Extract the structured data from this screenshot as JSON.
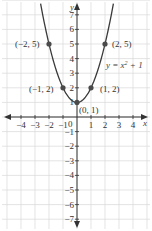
{
  "chart_data": {
    "type": "line",
    "title": "",
    "equation": "y = x² + 1",
    "xlabel": "x",
    "ylabel": "y",
    "xlim": [
      -4,
      4
    ],
    "ylim": [
      -7,
      7
    ],
    "grid": true,
    "x_ticks": [
      -4,
      -3,
      -2,
      -1,
      0,
      1,
      2,
      3,
      4
    ],
    "y_ticks": [
      -7,
      -6,
      -5,
      -4,
      -3,
      -2,
      -1,
      1,
      2,
      3,
      4,
      5,
      6,
      7
    ],
    "series": [
      {
        "name": "y = x² + 1",
        "function": "x^2+1",
        "x_range": [
          -2.6,
          2.6
        ],
        "color": "#3a3a3a"
      }
    ],
    "points": [
      {
        "x": -2,
        "y": 5,
        "label": "(−2, 5)"
      },
      {
        "x": -1,
        "y": 2,
        "label": "(−1, 2)"
      },
      {
        "x": 0,
        "y": 1,
        "label": "(0, 1)"
      },
      {
        "x": 1,
        "y": 2,
        "label": "(1, 2)"
      },
      {
        "x": 2,
        "y": 5,
        "label": "(2, 5)"
      }
    ]
  },
  "labels": {
    "x_axis": "x",
    "y_axis": "y",
    "equation": "y = x",
    "equation_exp": "2",
    "equation_tail": " + 1",
    "origin": "0",
    "p_m2": "(−2, 5)",
    "p_m1": "(−1, 2)",
    "p_0": "(0, 1)",
    "p_1": "(1, 2)",
    "p_2": "(2, 5)",
    "xt": [
      "−4",
      "−3",
      "−2",
      "−1",
      "1",
      "2",
      "3",
      "4"
    ],
    "yt_pos": [
      "1",
      "2",
      "3",
      "4",
      "5",
      "6",
      "7"
    ],
    "yt_neg": [
      "−1",
      "−2",
      "−3",
      "−4",
      "−5",
      "−6",
      "−7"
    ]
  }
}
